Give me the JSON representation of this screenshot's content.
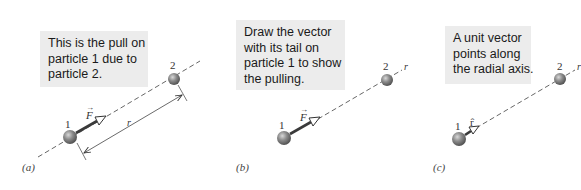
{
  "figure": {
    "panels": [
      {
        "id": "a",
        "label": "(a)",
        "callout": [
          "This is the pull on",
          "particle 1 due to",
          "particle 2."
        ],
        "particle1_label": "1",
        "particle2_label": "2",
        "vector_label": "F",
        "distance_label": "r"
      },
      {
        "id": "b",
        "label": "(b)",
        "callout": [
          "Draw the vector",
          "with its tail on",
          "particle 1 to show",
          "the pulling."
        ],
        "particle1_label": "1",
        "particle2_label": "2",
        "vector_label": "F",
        "axis_label": "r"
      },
      {
        "id": "c",
        "label": "(c)",
        "callout": [
          "A unit vector",
          "points along",
          "the radial axis."
        ],
        "particle1_label": "1",
        "particle2_label": "2",
        "vector_label": "r̂",
        "axis_label": "r"
      }
    ],
    "colors": {
      "callout_bg": "#ececec",
      "particle": "#7a7a7a",
      "line": "#444444"
    }
  }
}
